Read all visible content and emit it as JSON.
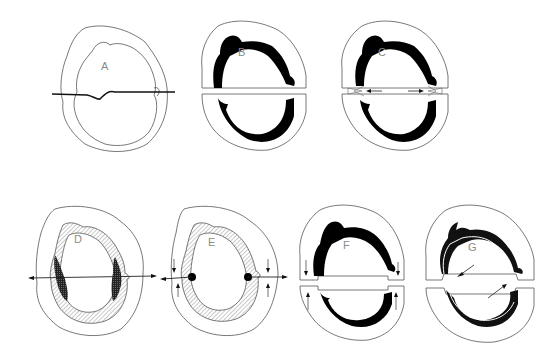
{
  "figure": {
    "panels": [
      {
        "id": "A",
        "label": "A",
        "description": "outline with horizontal cutting line"
      },
      {
        "id": "B",
        "label": "B",
        "description": "split with thick dark lining"
      },
      {
        "id": "C",
        "label": "C",
        "description": "split with inward arrows at junctions"
      },
      {
        "id": "D",
        "label": "D",
        "description": "hatched lining with dark lateral regions and outward double arrow"
      },
      {
        "id": "E",
        "label": "E",
        "description": "hatched lining with dots and vertical/horizontal arrows"
      },
      {
        "id": "F",
        "label": "F",
        "description": "split halves with vertical arrows"
      },
      {
        "id": "G",
        "label": "G",
        "description": "split with diagonal inward arrows, thin lined lining"
      }
    ],
    "colors": {
      "outline": "#444444",
      "fill_dark": "#000000",
      "hatch": "#888888",
      "label": "#8a8a8a",
      "background": "#ffffff"
    }
  }
}
